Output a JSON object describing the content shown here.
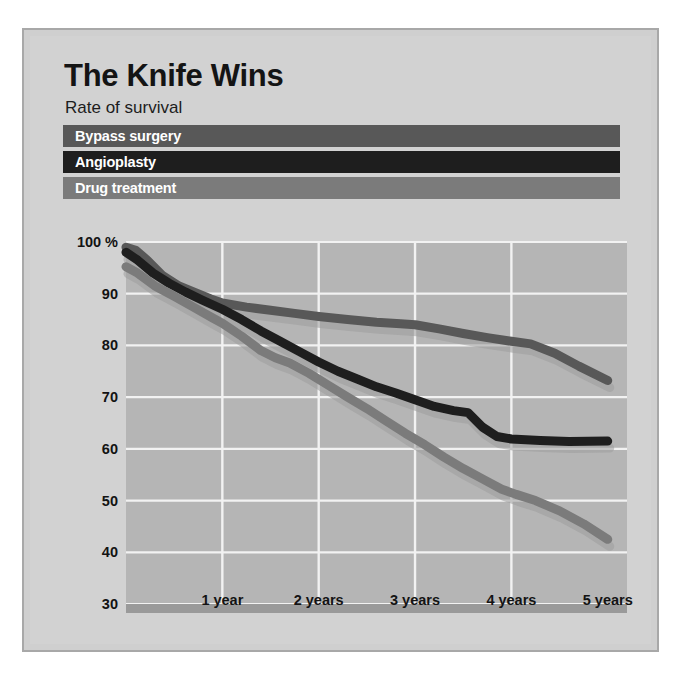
{
  "figure": {
    "title": "The Knife Wins",
    "subtitle": "Rate of survival"
  },
  "legend": {
    "items": [
      {
        "label": "Bypass surgery",
        "color": "#585858"
      },
      {
        "label": "Angioplasty",
        "color": "#1e1e1e"
      },
      {
        "label": "Drug treatment",
        "color": "#7b7b7b"
      }
    ]
  },
  "colors": {
    "panel_background": "#cfcfcf",
    "plot_background": "#b5b5b5",
    "gridline": "#f2f2f2",
    "text": "#131313",
    "bypass": "#585858",
    "angioplasty": "#1e1e1e",
    "drug": "#7b7b7b"
  },
  "chart_data": {
    "type": "line",
    "title": "The Knife Wins",
    "subtitle": "Rate of survival",
    "xlabel": "",
    "ylabel": "Rate of survival (%)",
    "ylim": [
      30,
      100
    ],
    "xlim": [
      0,
      5.2
    ],
    "grid": true,
    "legend_position": "top",
    "y_ticks": [
      "100 %",
      "90",
      "80",
      "70",
      "60",
      "50",
      "40",
      "30"
    ],
    "y_tick_values": [
      100,
      90,
      80,
      70,
      60,
      50,
      40,
      30
    ],
    "x_ticks": [
      "1 year",
      "2 years",
      "3 years",
      "4 years",
      "5 years"
    ],
    "x_tick_values": [
      1,
      2,
      3,
      4,
      5
    ],
    "series": [
      {
        "name": "Bypass surgery",
        "color": "#585858",
        "x": [
          0.0,
          0.1,
          0.22,
          0.38,
          0.55,
          0.72,
          0.88,
          1.0,
          1.25,
          1.5,
          1.75,
          2.0,
          2.3,
          2.6,
          2.85,
          3.0,
          3.25,
          3.5,
          3.75,
          4.0,
          4.2,
          4.45,
          4.7,
          5.0
        ],
        "y": [
          99.0,
          98.4,
          96.5,
          93.5,
          91.5,
          90.2,
          89.0,
          88.2,
          87.4,
          86.8,
          86.2,
          85.6,
          85.0,
          84.5,
          84.2,
          84.0,
          83.2,
          82.3,
          81.5,
          80.8,
          80.3,
          78.5,
          76.0,
          73.2
        ]
      },
      {
        "name": "Angioplasty",
        "color": "#1e1e1e",
        "x": [
          0.0,
          0.12,
          0.28,
          0.45,
          0.62,
          0.8,
          1.0,
          1.2,
          1.4,
          1.6,
          1.8,
          2.0,
          2.2,
          2.4,
          2.6,
          2.8,
          3.0,
          3.2,
          3.4,
          3.55,
          3.7,
          3.85,
          4.0,
          4.3,
          4.6,
          5.0
        ],
        "y": [
          98.0,
          96.5,
          94.0,
          92.0,
          90.3,
          88.7,
          87.0,
          85.0,
          82.8,
          80.8,
          78.8,
          76.8,
          75.0,
          73.5,
          72.0,
          70.8,
          69.5,
          68.2,
          67.4,
          67.0,
          64.2,
          62.4,
          61.9,
          61.6,
          61.4,
          61.5
        ]
      },
      {
        "name": "Drug treatment",
        "color": "#7b7b7b",
        "x": [
          0.0,
          0.12,
          0.3,
          0.5,
          0.7,
          0.9,
          1.0,
          1.2,
          1.4,
          1.55,
          1.7,
          1.9,
          2.1,
          2.3,
          2.5,
          2.7,
          2.9,
          3.1,
          3.3,
          3.5,
          3.7,
          3.9,
          4.05,
          4.25,
          4.5,
          4.75,
          5.0
        ],
        "y": [
          95.2,
          94.0,
          91.5,
          89.5,
          87.4,
          85.3,
          84.3,
          81.8,
          79.0,
          77.6,
          76.6,
          74.6,
          72.3,
          70.0,
          67.8,
          65.4,
          63.0,
          60.8,
          58.4,
          56.2,
          54.2,
          52.2,
          51.2,
          50.0,
          48.0,
          45.5,
          42.5
        ]
      }
    ]
  },
  "plot_geometry": {
    "left": 96,
    "right": 597,
    "top": 8,
    "bottom": 370,
    "note": "internal layout values in svg user units"
  }
}
